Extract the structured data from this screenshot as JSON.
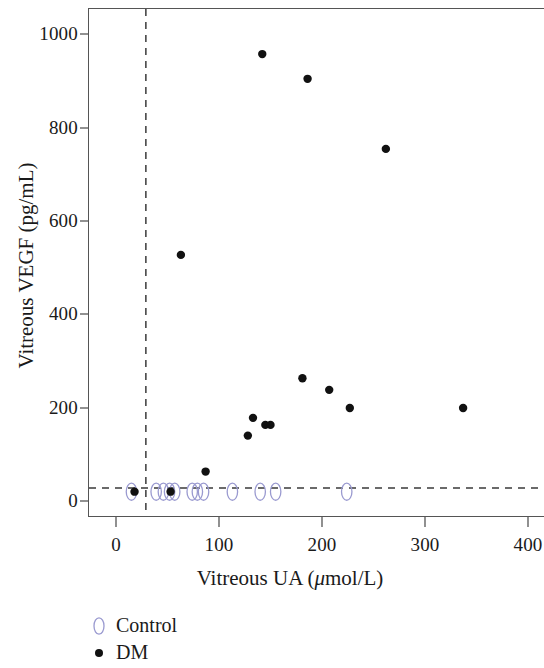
{
  "figure": {
    "background": "#ffffff",
    "frame_color": "#555555"
  },
  "axes": {
    "x": {
      "title_prefix": "Vitreous UA (",
      "title_mu": "μ",
      "title_suffix": "mol/L)",
      "title_full": "Vitreous UA (μmol/L)",
      "ticks": [
        0,
        100,
        200,
        300,
        400
      ],
      "tick_labels": [
        "0",
        "100",
        "200",
        "300",
        "400"
      ],
      "min": -25,
      "max": 415
    },
    "y": {
      "title_full": "Vitreous VEGF (pg/mL)",
      "ticks": [
        0,
        200,
        400,
        600,
        800,
        1000
      ],
      "tick_labels": [
        "0",
        "200",
        "400",
        "600",
        "800",
        "1000"
      ],
      "min": -55,
      "max": 1035
    }
  },
  "reference_lines": {
    "vertical": {
      "value": 29,
      "style": "dashed",
      "color": "#3a3a3a"
    },
    "horizontal": {
      "value": 28,
      "style": "dashed",
      "color": "#3a3a3a"
    }
  },
  "legend": {
    "position": "below-axis-left",
    "entries": [
      {
        "label": "Control",
        "marker": "open-ellipse",
        "color": "#9a9ad0"
      },
      {
        "label": "DM",
        "marker": "filled-circle",
        "color": "#111111"
      }
    ]
  },
  "chart_data": {
    "type": "scatter",
    "title": "",
    "xlabel": "Vitreous UA (μmol/L)",
    "ylabel": "Vitreous VEGF (pg/mL)",
    "xlim": [
      -25,
      415
    ],
    "ylim": [
      -55,
      1035
    ],
    "xticks": [
      0,
      100,
      200,
      300,
      400
    ],
    "yticks": [
      0,
      200,
      400,
      600,
      800,
      1000
    ],
    "grid": false,
    "legend_position": "below-axis-left",
    "reference_lines": [
      {
        "orientation": "vertical",
        "x": 29,
        "style": "dashed"
      },
      {
        "orientation": "horizontal",
        "y": 28,
        "style": "dashed"
      }
    ],
    "series": [
      {
        "name": "Control",
        "marker": "open-ellipse",
        "color": "#9a9ad0",
        "points": [
          {
            "x": 15,
            "y": 20
          },
          {
            "x": 39,
            "y": 20
          },
          {
            "x": 46,
            "y": 20
          },
          {
            "x": 52,
            "y": 20
          },
          {
            "x": 57,
            "y": 20
          },
          {
            "x": 74,
            "y": 20
          },
          {
            "x": 79,
            "y": 20
          },
          {
            "x": 85,
            "y": 20
          },
          {
            "x": 113,
            "y": 20
          },
          {
            "x": 140,
            "y": 20
          },
          {
            "x": 155,
            "y": 20
          },
          {
            "x": 224,
            "y": 20
          }
        ]
      },
      {
        "name": "DM",
        "marker": "filled-circle",
        "color": "#111111",
        "points": [
          {
            "x": 18,
            "y": 20
          },
          {
            "x": 53,
            "y": 20
          },
          {
            "x": 63,
            "y": 527
          },
          {
            "x": 87,
            "y": 63
          },
          {
            "x": 128,
            "y": 140
          },
          {
            "x": 133,
            "y": 178
          },
          {
            "x": 142,
            "y": 957
          },
          {
            "x": 145,
            "y": 163
          },
          {
            "x": 150,
            "y": 163
          },
          {
            "x": 181,
            "y": 263
          },
          {
            "x": 186,
            "y": 904
          },
          {
            "x": 207,
            "y": 238
          },
          {
            "x": 227,
            "y": 199
          },
          {
            "x": 262,
            "y": 754
          },
          {
            "x": 337,
            "y": 199
          }
        ]
      }
    ]
  }
}
